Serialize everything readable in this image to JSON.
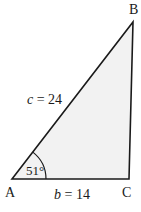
{
  "diagram": {
    "type": "right-triangle",
    "vertices": {
      "A": {
        "label": "A",
        "x": 12,
        "y": 179
      },
      "B": {
        "label": "B",
        "x": 133,
        "y": 22
      },
      "C": {
        "label": "C",
        "x": 129,
        "y": 179
      }
    },
    "sides": {
      "c": {
        "label_var": "c",
        "label_eq": " = 24",
        "value": 24
      },
      "b": {
        "label_var": "b",
        "label_eq": " = 14",
        "value": 14
      }
    },
    "angle_A": {
      "label": "51°",
      "value": 51
    },
    "colors": {
      "fill": "#f2f2f2",
      "stroke": "#1a1a1a"
    }
  }
}
